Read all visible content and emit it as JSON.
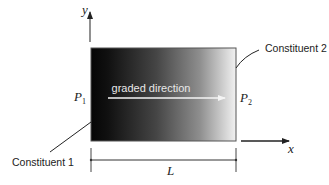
{
  "diagram": {
    "axes": {
      "x_label": "x",
      "y_label": "y"
    },
    "bar": {
      "gradient_start_color": "#0a0a0a",
      "gradient_end_color": "#f0f0f0",
      "border_color": "#444444"
    },
    "graded_direction_label": "graded direction",
    "points": {
      "p1": {
        "symbol": "P",
        "subscript": "1"
      },
      "p2": {
        "symbol": "P",
        "subscript": "2"
      }
    },
    "constituents": {
      "left": "Constituent 1",
      "right": "Constituent 2"
    },
    "dimension": {
      "length_label": "L"
    }
  }
}
